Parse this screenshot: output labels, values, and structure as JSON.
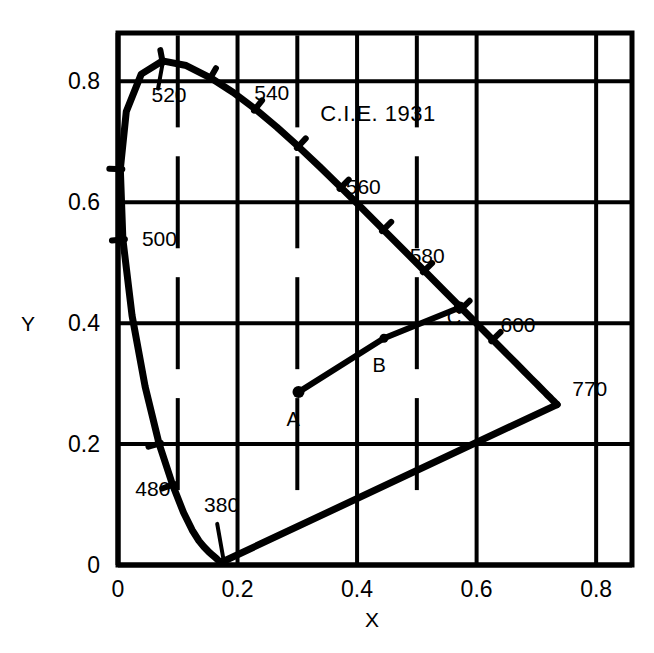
{
  "figure": {
    "title": "C.I.E. 1931",
    "title_position": {
      "x": 0.435,
      "y": 0.735
    }
  },
  "axes": {
    "x": {
      "label": "X",
      "tick_labels": [
        "0",
        "0.2",
        "0.4",
        "0.6",
        "0.8"
      ],
      "tick_values": [
        0,
        0.2,
        0.4,
        0.6,
        0.8
      ],
      "range": [
        0,
        0.86
      ],
      "minor_ticks": [
        0.1,
        0.3,
        0.5
      ]
    },
    "y": {
      "label": "Y",
      "tick_labels": [
        "0",
        "0.2",
        "0.4",
        "0.6",
        "0.8"
      ],
      "tick_values": [
        0,
        0.2,
        0.4,
        0.6,
        0.8
      ],
      "range": [
        0,
        0.88
      ],
      "minor_ticks": []
    },
    "grid": "on"
  },
  "chart_data": {
    "type": "line",
    "title": "C.I.E. 1931",
    "xlabel": "X",
    "ylabel": "Y",
    "xlim": [
      0,
      0.86
    ],
    "ylim": [
      0,
      0.88
    ],
    "grid": true,
    "legend": "none",
    "series": [
      {
        "name": "spectral-locus",
        "closed": true,
        "points": [
          [
            0.1741,
            0.005
          ],
          [
            0.174,
            0.005
          ],
          [
            0.1738,
            0.0049
          ],
          [
            0.1736,
            0.0049
          ],
          [
            0.1733,
            0.0048
          ],
          [
            0.173,
            0.0048
          ],
          [
            0.1726,
            0.0048
          ],
          [
            0.1721,
            0.0048
          ],
          [
            0.1714,
            0.0051
          ],
          [
            0.1703,
            0.0058
          ],
          [
            0.1689,
            0.0069
          ],
          [
            0.1669,
            0.0086
          ],
          [
            0.1644,
            0.0109
          ],
          [
            0.1611,
            0.0138
          ],
          [
            0.1566,
            0.0177
          ],
          [
            0.151,
            0.0227
          ],
          [
            0.144,
            0.0297
          ],
          [
            0.1355,
            0.0399
          ],
          [
            0.1241,
            0.0578
          ],
          [
            0.1096,
            0.0868
          ],
          [
            0.0913,
            0.1327
          ],
          [
            0.0687,
            0.2007
          ],
          [
            0.0454,
            0.295
          ],
          [
            0.0235,
            0.4127
          ],
          [
            0.0082,
            0.5384
          ],
          [
            0.0039,
            0.6548
          ],
          [
            0.0139,
            0.7502
          ],
          [
            0.0389,
            0.812
          ],
          [
            0.0743,
            0.8338
          ],
          [
            0.1142,
            0.8262
          ],
          [
            0.1547,
            0.8059
          ],
          [
            0.1929,
            0.7816
          ],
          [
            0.2296,
            0.7543
          ],
          [
            0.2658,
            0.7243
          ],
          [
            0.3016,
            0.6923
          ],
          [
            0.3373,
            0.6589
          ],
          [
            0.3731,
            0.6245
          ],
          [
            0.4087,
            0.5896
          ],
          [
            0.4441,
            0.5547
          ],
          [
            0.4788,
            0.5202
          ],
          [
            0.5125,
            0.4866
          ],
          [
            0.5448,
            0.4544
          ],
          [
            0.5752,
            0.4242
          ],
          [
            0.6029,
            0.3965
          ],
          [
            0.627,
            0.3725
          ],
          [
            0.6482,
            0.3514
          ],
          [
            0.6658,
            0.334
          ],
          [
            0.6801,
            0.3197
          ],
          [
            0.6915,
            0.3083
          ],
          [
            0.7006,
            0.2993
          ],
          [
            0.7079,
            0.292
          ],
          [
            0.714,
            0.2859
          ],
          [
            0.719,
            0.2809
          ],
          [
            0.723,
            0.277
          ],
          [
            0.726,
            0.274
          ],
          [
            0.7283,
            0.2717
          ],
          [
            0.73,
            0.27
          ],
          [
            0.7311,
            0.2689
          ],
          [
            0.732,
            0.268
          ],
          [
            0.7327,
            0.2673
          ],
          [
            0.7334,
            0.2666
          ],
          [
            0.734,
            0.266
          ],
          [
            0.7344,
            0.2656
          ],
          [
            0.7346,
            0.2654
          ],
          [
            0.7347,
            0.2653
          ]
        ]
      },
      {
        "name": "purple-line",
        "points": [
          [
            0.7347,
            0.2653
          ],
          [
            0.1741,
            0.005
          ]
        ]
      },
      {
        "name": "abc-line",
        "points": [
          [
            0.302,
            0.286
          ],
          [
            0.445,
            0.375
          ],
          [
            0.572,
            0.426
          ]
        ]
      }
    ],
    "wavelength_ticks": [
      {
        "label": "380",
        "x": 0.1741,
        "y": 0.005,
        "label_x": 0.144,
        "label_y": 0.087
      },
      {
        "label": "480",
        "x": 0.0913,
        "y": 0.1327,
        "label_x": 0.029,
        "label_y": 0.114
      },
      {
        "label": "500",
        "x": 0.0082,
        "y": 0.5384,
        "label_x": 0.04,
        "label_y": 0.528
      },
      {
        "label": "520",
        "x": 0.0743,
        "y": 0.8338,
        "label_x": 0.056,
        "label_y": 0.766
      },
      {
        "label": "540",
        "x": 0.2296,
        "y": 0.7543,
        "label_x": 0.228,
        "label_y": 0.77
      },
      {
        "label": "560",
        "x": 0.3731,
        "y": 0.6245,
        "label_x": 0.381,
        "label_y": 0.614
      },
      {
        "label": "580",
        "x": 0.5125,
        "y": 0.4866,
        "label_x": 0.488,
        "label_y": 0.5
      },
      {
        "label": "600",
        "x": 0.627,
        "y": 0.3725,
        "label_x": 0.64,
        "label_y": 0.385
      },
      {
        "label": "770",
        "x": 0.7347,
        "y": 0.2653,
        "label_x": 0.76,
        "label_y": 0.28
      }
    ],
    "unlabeled_ticks": [
      {
        "x": 0.0687,
        "y": 0.2007
      },
      {
        "x": 0.0039,
        "y": 0.6548
      },
      {
        "x": 0.1547,
        "y": 0.8059
      },
      {
        "x": 0.3016,
        "y": 0.6923
      },
      {
        "x": 0.4441,
        "y": 0.5547
      },
      {
        "x": 0.5752,
        "y": 0.4242
      }
    ],
    "annotated_points": [
      {
        "label": "A",
        "x": 0.302,
        "y": 0.286,
        "label_x": 0.293,
        "label_y": 0.23
      },
      {
        "label": "B",
        "x": 0.445,
        "y": 0.375,
        "label_x": 0.437,
        "label_y": 0.32
      },
      {
        "label": "C",
        "x": 0.572,
        "y": 0.426,
        "label_x": 0.562,
        "label_y": 0.398
      }
    ]
  },
  "colors": {
    "ink": "#000000",
    "background": "#ffffff"
  }
}
